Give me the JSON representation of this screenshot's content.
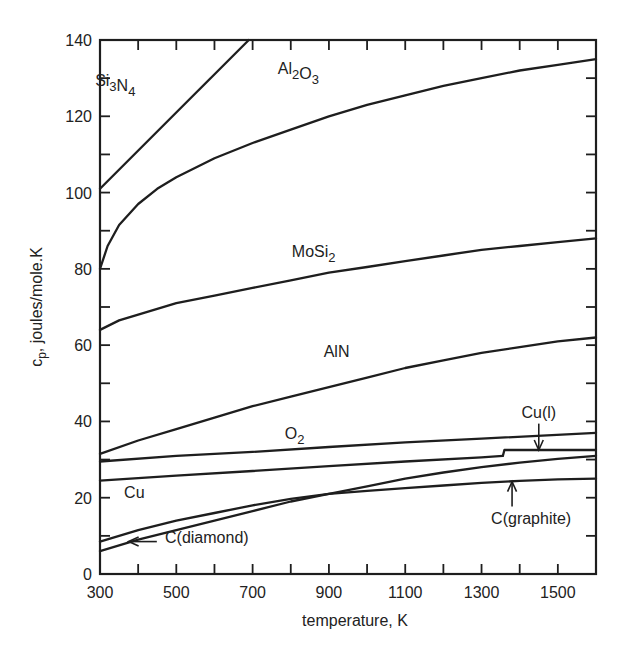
{
  "chart_data": {
    "type": "line",
    "title": "",
    "xlabel": "temperature, K",
    "ylabel": "c_p, joules/mole.K",
    "ylabel_main": "c",
    "ylabel_sub": "p",
    "ylabel_rest": ", joules/mole.K",
    "xlim": [
      300,
      1600
    ],
    "ylim": [
      0,
      140
    ],
    "grid": false,
    "legend": "inline labels",
    "x_ticks_major": [
      300,
      500,
      700,
      900,
      1100,
      1300,
      1500
    ],
    "x_ticks_minor": [
      400,
      600,
      800,
      1000,
      1200,
      1400
    ],
    "y_ticks_major": [
      0,
      20,
      40,
      60,
      80,
      100,
      120,
      140
    ],
    "y_ticks_minor": [
      10,
      30,
      50,
      70,
      90,
      110,
      130
    ],
    "series": [
      {
        "name": "Si3N4",
        "label_main": [
          "Si",
          "N"
        ],
        "label_sub": [
          "3",
          "4"
        ],
        "x": [
          300,
          690
        ],
        "y": [
          101,
          140
        ]
      },
      {
        "name": "Al2O3",
        "label_main": [
          "Al",
          "O"
        ],
        "label_sub": [
          "2",
          "3"
        ],
        "x": [
          300,
          320,
          350,
          400,
          450,
          500,
          600,
          700,
          800,
          900,
          1000,
          1100,
          1200,
          1300,
          1400,
          1500,
          1600
        ],
        "y": [
          80,
          86,
          91.5,
          97,
          101,
          104,
          109,
          113,
          116.5,
          120,
          123,
          125.5,
          128,
          130,
          132,
          133.5,
          135
        ]
      },
      {
        "name": "MoSi2",
        "label_main": [
          "MoSi"
        ],
        "label_sub": [
          "2"
        ],
        "x": [
          300,
          350,
          400,
          500,
          600,
          700,
          800,
          900,
          1000,
          1100,
          1200,
          1300,
          1400,
          1500,
          1600
        ],
        "y": [
          64,
          66.5,
          68,
          71,
          73,
          75,
          77,
          79,
          80.5,
          82,
          83.5,
          85,
          86,
          87,
          88
        ]
      },
      {
        "name": "AlN",
        "label_main": [
          "AlN"
        ],
        "label_sub": [],
        "x": [
          300,
          400,
          500,
          600,
          700,
          800,
          900,
          1000,
          1100,
          1200,
          1300,
          1400,
          1500,
          1600
        ],
        "y": [
          31.5,
          35,
          38,
          41,
          44,
          46.5,
          49,
          51.5,
          54,
          56,
          58,
          59.5,
          61,
          62
        ]
      },
      {
        "name": "O2",
        "label_main": [
          "O"
        ],
        "label_sub": [
          "2"
        ],
        "x": [
          300,
          500,
          700,
          900,
          1100,
          1300,
          1600
        ],
        "y": [
          29.5,
          31,
          32,
          33.3,
          34.5,
          35.5,
          37
        ]
      },
      {
        "name": "Cu",
        "label_main": [
          "Cu"
        ],
        "label_sub": [],
        "x": [
          300,
          500,
          700,
          900,
          1100,
          1300,
          1356
        ],
        "y": [
          24.5,
          25.8,
          27,
          28.3,
          29.5,
          30.6,
          31
        ]
      },
      {
        "name": "Cu(l)",
        "label_main": [
          "Cu(l)"
        ],
        "label_sub": [],
        "x": [
          1356,
          1360,
          1600
        ],
        "y": [
          31,
          32.5,
          32.5
        ]
      },
      {
        "name": "C(graphite)",
        "label_main": [
          "C(graphite)"
        ],
        "label_sub": [],
        "x": [
          300,
          400,
          500,
          600,
          700,
          800,
          900,
          1000,
          1100,
          1200,
          1300,
          1400,
          1500,
          1600
        ],
        "y": [
          8.5,
          11.5,
          14,
          16,
          18,
          19.7,
          21,
          21.8,
          22.5,
          23.2,
          23.9,
          24.4,
          24.8,
          25
        ]
      },
      {
        "name": "C(diamond)",
        "label_main": [
          "C(diamond)"
        ],
        "label_sub": [],
        "x": [
          300,
          400,
          500,
          600,
          700,
          800,
          900,
          1000,
          1100,
          1200,
          1300,
          1400,
          1500,
          1600
        ],
        "y": [
          6,
          9,
          11.5,
          14,
          16.5,
          19,
          21,
          23,
          25,
          26.6,
          28,
          29.2,
          30.2,
          31
        ]
      }
    ],
    "annotations": [
      {
        "text": "Si3N4",
        "x": 340,
        "y": 128
      },
      {
        "text": "Al2O3",
        "x": 820,
        "y": 131
      },
      {
        "text": "MoSi2",
        "x": 860,
        "y": 83
      },
      {
        "text": "AlN",
        "x": 920,
        "y": 57
      },
      {
        "text": "O2",
        "x": 810,
        "y": 35.5
      },
      {
        "text": "Cu",
        "x": 390,
        "y": 20
      },
      {
        "text": "Cu(l)",
        "x": 1450,
        "y": 41,
        "arrow_to": [
          1450,
          32.5
        ]
      },
      {
        "text": "C(graphite)",
        "x": 1430,
        "y": 13,
        "arrow_to": [
          1380,
          24.2
        ]
      },
      {
        "text": "C(diamond)",
        "x": 580,
        "y": 8,
        "arrow_to": [
          375,
          8.5
        ]
      }
    ]
  }
}
